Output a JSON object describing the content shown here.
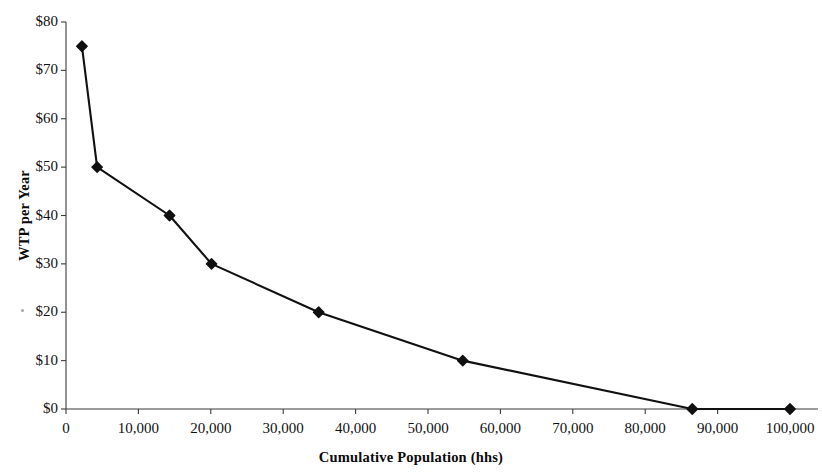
{
  "chart_data": {
    "type": "line",
    "title": "",
    "xlabel": "Cumulative Population (hhs)",
    "ylabel": "WTP per Year",
    "x": [
      2200,
      4300,
      14300,
      20100,
      34900,
      54800,
      86500,
      100000
    ],
    "values": [
      75,
      50,
      40,
      30,
      20,
      10,
      0,
      0
    ],
    "xlim": [
      0,
      100000
    ],
    "ylim": [
      0,
      80
    ],
    "xticks": [
      0,
      10000,
      20000,
      30000,
      40000,
      50000,
      60000,
      70000,
      80000,
      90000,
      100000
    ],
    "xtick_labels": [
      "0",
      "10,000",
      "20,000",
      "30,000",
      "40,000",
      "50,000",
      "60,000",
      "70,000",
      "80,000",
      "90,000",
      "100,000"
    ],
    "yticks": [
      0,
      10,
      20,
      30,
      40,
      50,
      60,
      70,
      80
    ],
    "ytick_labels": [
      "$0",
      "$10",
      "$20",
      "$30",
      "$40",
      "$50",
      "$60",
      "$70",
      "$80"
    ],
    "grid": false,
    "legend": false,
    "series_name": "WTP demand curve",
    "marker": "diamond",
    "line_color": "#111111",
    "marker_color": "#101010",
    "axis_color": "#3a3a3a"
  }
}
